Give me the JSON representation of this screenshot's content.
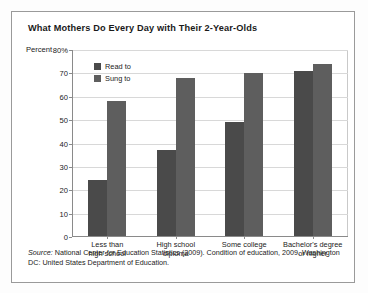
{
  "chart_data": {
    "type": "bar",
    "title": "What Mothers Do Every Day with Their 2-Year-Olds",
    "ylabel": "Percent",
    "xlabel": "",
    "categories": [
      "Less than\nhigh school",
      "High school\ndiploma",
      "Some college",
      "Bachelor's degree\nor higher"
    ],
    "category_lines": [
      [
        "Less than",
        "high school"
      ],
      [
        "High school",
        "diploma"
      ],
      [
        "Some college",
        ""
      ],
      [
        "Bachelor's degree",
        "or higher"
      ]
    ],
    "series": [
      {
        "name": "Read to",
        "color": "#4a4a4a",
        "values": [
          24,
          37,
          49,
          71
        ]
      },
      {
        "name": "Sung to",
        "color": "#5e5e5e",
        "values": [
          58,
          68,
          70,
          74
        ]
      }
    ],
    "ylim": [
      0,
      80
    ],
    "yticks": [
      80,
      70,
      60,
      50,
      40,
      30,
      20,
      10,
      0
    ],
    "ytick_labels": [
      "80%",
      "70",
      "60",
      "50",
      "40",
      "30",
      "20",
      "10",
      "0"
    ],
    "grid": true,
    "legend_position": "top-left-inside"
  },
  "source": {
    "label": "Source:",
    "text": " National Center for Education Statistics (2009). Condition of education, 2009. Washington DC: United States Department of Education."
  }
}
